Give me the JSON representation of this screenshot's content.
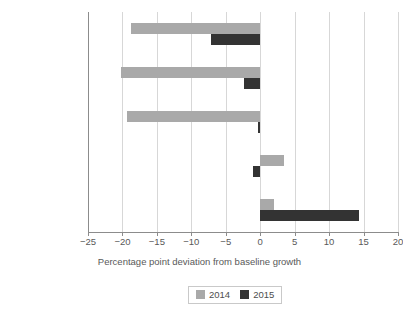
{
  "chart_data": {
    "type": "bar",
    "orientation": "horizontal",
    "title": "",
    "xlabel": "Percentage point deviation from baseline growth",
    "ylabel": "",
    "categories": [
      "Agriculture",
      "Industry",
      "Mining",
      "Private services",
      "Public services"
    ],
    "series": [
      {
        "name": "2014",
        "color": "#a9a9a9",
        "values": [
          -18.8,
          -20.2,
          -19.3,
          3.4,
          2.0
        ]
      },
      {
        "name": "2015",
        "color": "#333333",
        "values": [
          -7.1,
          -2.3,
          -0.3,
          -1.0,
          14.3
        ]
      }
    ],
    "xlim": [
      -25,
      20
    ],
    "xticks": [
      -25,
      -20,
      -15,
      -10,
      -5,
      0,
      5,
      10,
      15,
      20
    ],
    "xtick_labels": [
      "−25",
      "−20",
      "−15",
      "−10",
      "−5",
      "0",
      "5",
      "10",
      "15",
      "20"
    ],
    "grid": true,
    "grid_axis": "x",
    "legend_position": "bottom",
    "legend_entries": [
      "2014",
      "2015"
    ]
  }
}
